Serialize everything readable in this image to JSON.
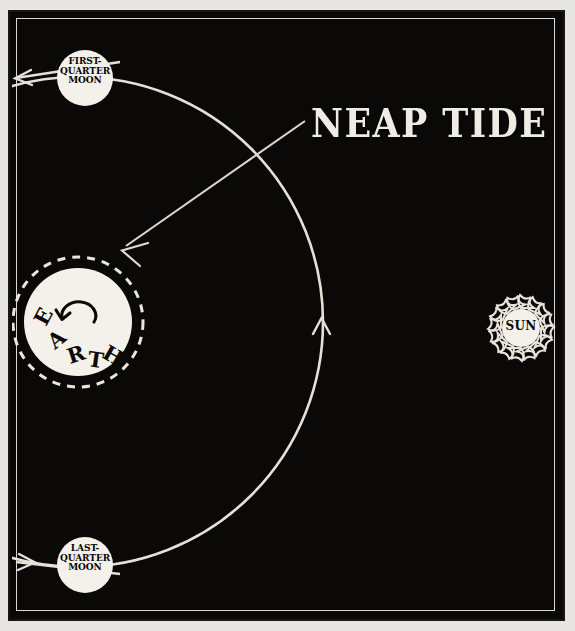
{
  "figure": {
    "title": "NEAP TIDE",
    "background_color": "#0a0907",
    "ink_color": "#ece8e1",
    "paper_color": "#e8e6e2"
  },
  "bodies": {
    "earth": {
      "name": "EARTH",
      "letters": [
        "E",
        "A",
        "R",
        "T",
        "H"
      ],
      "rotation_arrow": "counterclockwise-rotation-icon",
      "tidal_envelope": "dashed-ring"
    },
    "sun": {
      "name": "SUN",
      "rays": 16
    },
    "moon_first_quarter": {
      "lines": [
        "FIRST-",
        "QUARTER",
        "MOON"
      ]
    },
    "moon_last_quarter": {
      "lines": [
        "LAST-",
        "QUARTER",
        "MOON"
      ]
    }
  },
  "annotations": {
    "leader_label": "NEAP TIDE",
    "orbit_direction_arrow": "up-arrowhead",
    "sunlight_arrow_top": "left-arrowhead",
    "sunlight_arrow_bottom": "right-arrowhead"
  }
}
